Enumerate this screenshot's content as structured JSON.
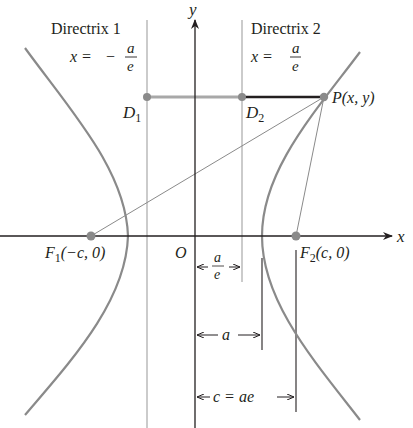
{
  "diagram": {
    "axes": {
      "x_label": "x",
      "y_label": "y",
      "origin_label": "O"
    },
    "directrix1": {
      "title": "Directrix 1",
      "eq_lhs": "x =",
      "eq_sign": "−",
      "eq_num": "a",
      "eq_den": "e"
    },
    "directrix2": {
      "title": "Directrix 2",
      "eq_lhs": "x =",
      "eq_num": "a",
      "eq_den": "e"
    },
    "points": {
      "D1": {
        "letter": "D",
        "sub": "1"
      },
      "D2": {
        "letter": "D",
        "sub": "2"
      },
      "P": {
        "label": "P(x, y)"
      },
      "F1": {
        "letter": "F",
        "sub": "1",
        "coords": "(−c, 0)"
      },
      "F2": {
        "letter": "F",
        "sub": "2",
        "coords": "(c, 0)"
      }
    },
    "dimensions": {
      "a_over_e": {
        "num": "a",
        "den": "e"
      },
      "a": "a",
      "c": "c = ae"
    },
    "colors": {
      "curve": "#8a8a8a",
      "axis": "#231f20",
      "guide": "#a0a0a0",
      "segment_dark": "#231f20",
      "segment_light": "#a8a8a8",
      "point": "#8a8a8a"
    }
  }
}
